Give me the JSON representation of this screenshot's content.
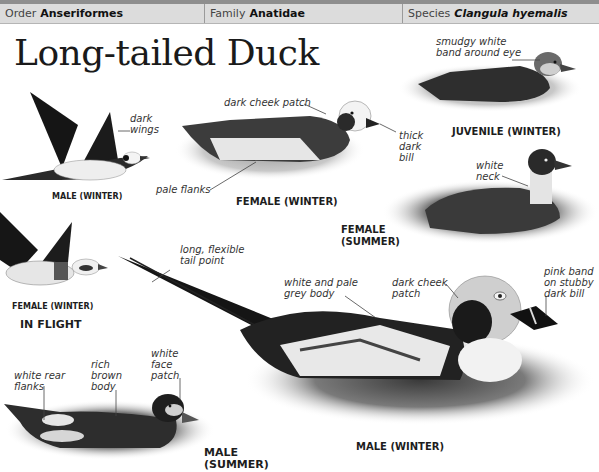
{
  "taxonomy": {
    "order": {
      "label": "Order",
      "value": "Anseriformes"
    },
    "family": {
      "label": "Family",
      "value": "Anatidae"
    },
    "species": {
      "label": "Species",
      "value": "Clangula hyemalis"
    }
  },
  "title": "Long-tailed Duck",
  "illustrations": {
    "male_winter_flight": {
      "caption": "MALE (WINTER)",
      "annotations": [
        "dark wings"
      ]
    },
    "female_winter_flight": {
      "caption": "FEMALE (WINTER)"
    },
    "in_flight_label": "IN FLIGHT",
    "female_winter": {
      "caption": "FEMALE (WINTER)",
      "annotations": [
        "dark cheek patch",
        "thick dark bill",
        "pale flanks"
      ]
    },
    "juvenile_winter": {
      "caption": "JUVENILE (WINTER)",
      "annotations": [
        "smudgy white band around eye"
      ]
    },
    "female_summer": {
      "caption_line1": "FEMALE",
      "caption_line2": "(SUMMER)",
      "annotations": [
        "white neck"
      ]
    },
    "male_winter": {
      "caption": "MALE (WINTER)",
      "annotations": [
        "long, flexible tail point",
        "white and pale grey body",
        "dark cheek patch",
        "pink band on stubby dark bill"
      ]
    },
    "male_summer": {
      "caption_line1": "MALE",
      "caption_line2": "(SUMMER)",
      "annotations": [
        "white rear flanks",
        "rich brown body",
        "white face patch"
      ]
    }
  },
  "annotation_lines": {
    "dark_wings": [
      "dark",
      "wings"
    ],
    "dark_cheek_patch_f": [
      "dark cheek patch"
    ],
    "thick_dark_bill": [
      "thick",
      "dark",
      "bill"
    ],
    "pale_flanks": [
      "pale flanks"
    ],
    "smudgy": [
      "smudgy white",
      "band around eye"
    ],
    "white_neck": [
      "white",
      "neck"
    ],
    "long_tail": [
      "long, flexible",
      "tail point"
    ],
    "white_pale_grey": [
      "white and pale",
      "grey body"
    ],
    "dark_cheek_patch_m": [
      "dark cheek",
      "patch"
    ],
    "pink_band": [
      "pink band",
      "on stubby",
      "dark bill"
    ],
    "white_rear": [
      "white rear",
      "flanks"
    ],
    "rich_brown": [
      "rich",
      "brown",
      "body"
    ],
    "white_face": [
      "white",
      "face",
      "patch"
    ]
  },
  "colors": {
    "header_bg": "#dcdcdc",
    "header_top_border": "#8e8e8e",
    "text": "#1a1a1a"
  }
}
